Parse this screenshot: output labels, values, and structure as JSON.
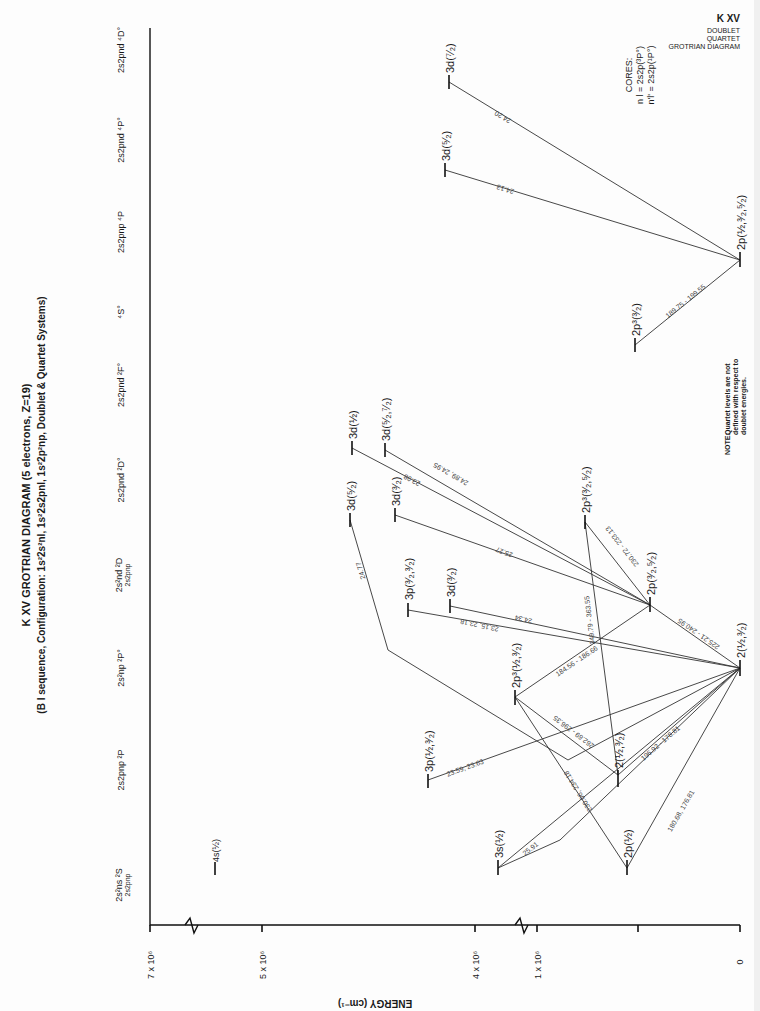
{
  "header": {
    "ion": "K XV",
    "line1": "DOUBLET",
    "line2": "QUARTET",
    "line3": "GROTRIAN DIAGRAM"
  },
  "title": {
    "main": "K XV GROTRIAN DIAGRAM (5 electrons, Z=19)",
    "sub": "(B I sequence, Configuration: 1s²2s²nl, 1s²2s2pnl, 1s²2p²np, Doublet & Quartet Systems)"
  },
  "axis": {
    "label": "ENERGY (cm⁻¹)",
    "ticks": [
      "7 x 10⁶",
      "5 x 10⁶",
      "4 x 10⁶",
      "1 x 10⁶",
      "0"
    ]
  },
  "columns": [
    {
      "id": "c1",
      "label": "2s²ns ²S",
      "sublabel": "2s2pnp"
    },
    {
      "id": "c2",
      "label": "2s2pnp ²P"
    },
    {
      "id": "c3",
      "label": "2s²np ²P°"
    },
    {
      "id": "c4",
      "label": "2s²nd ²D",
      "sublabel": "2s2pnp"
    },
    {
      "id": "c5",
      "label": "2s2pnd ²D°"
    },
    {
      "id": "c6",
      "label": "2s2pnd ²F°"
    },
    {
      "id": "c7",
      "label": "⁴S°"
    },
    {
      "id": "c8",
      "label": "2s2pnp ⁴P"
    },
    {
      "id": "c9",
      "label": "2s2pnd ⁴P°"
    },
    {
      "id": "c10",
      "label": "2s2pnd ⁴D°"
    }
  ],
  "levels": [
    {
      "id": "L4s",
      "label": "4s(½)"
    },
    {
      "id": "L3s",
      "label": "3s(½)"
    },
    {
      "id": "L2p_half",
      "label": "2p(½)"
    },
    {
      "id": "L3p_a",
      "label": "3p(½,³⁄₂)"
    },
    {
      "id": "L2_a",
      "label": "2(½,³⁄₂)"
    },
    {
      "id": "L2p3_a",
      "label": "2p³(½,³⁄₂)"
    },
    {
      "id": "L2_ground",
      "label": "2(½,³⁄₂)"
    },
    {
      "id": "L3p_b",
      "label": "3p(³⁄₂,³⁄₂)"
    },
    {
      "id": "L3d_a",
      "label": "3d(³⁄₂)"
    },
    {
      "id": "L3d_b",
      "label": "3d(⁵⁄₂)"
    },
    {
      "id": "L3d_c",
      "label": "3d(³⁄₂)"
    },
    {
      "id": "L2p_b",
      "label": "2p(³⁄₂,⁵⁄₂)"
    },
    {
      "id": "L2p3_b",
      "label": "2p³(³⁄₂,⁵⁄₂)"
    },
    {
      "id": "L3d_d",
      "label": "3d(½)"
    },
    {
      "id": "L3d_e",
      "label": "3d(⁵⁄₂,⁷⁄₂)"
    },
    {
      "id": "L2p3_q",
      "label": "2p³(³⁄₂)"
    },
    {
      "id": "L2p_q",
      "label": "2p(½,³⁄₂,⁵⁄₂)"
    },
    {
      "id": "L3d_q1",
      "label": "3d(⁵⁄₂)"
    },
    {
      "id": "L3d_q2",
      "label": "3d(⁷⁄₂)"
    }
  ],
  "transitions": [
    {
      "label": "25.91"
    },
    {
      "label": "180.68, 176.81"
    },
    {
      "label": "196.92 - 178.81"
    },
    {
      "label": "23.59, 23.63"
    },
    {
      "label": "230.06, 234.18"
    },
    {
      "label": "262.69 - 296.35"
    },
    {
      "label": "184.56 - 186.66"
    },
    {
      "label": "349.79 - 363.55"
    },
    {
      "label": "225.21 - 240.95"
    },
    {
      "label": "230.72 - 233.13"
    },
    {
      "label": "23.15, 23.18"
    },
    {
      "label": "24.34"
    },
    {
      "label": "24.77"
    },
    {
      "label": "25.27"
    },
    {
      "label": "23.98"
    },
    {
      "label": "24.89, 24.95"
    },
    {
      "label": "189.75 - 199.55"
    },
    {
      "label": "24.13"
    },
    {
      "label": "24.20"
    }
  ],
  "cores": {
    "title": "CORES:",
    "line1": "n l = 2s2p(³P°)",
    "line2": "n'l' = 2s2p(¹P°)"
  },
  "note": {
    "head": "NOTE:",
    "line1": "Quartet levels are not",
    "line2": "defined with respect to",
    "line3": "doublet energies."
  }
}
